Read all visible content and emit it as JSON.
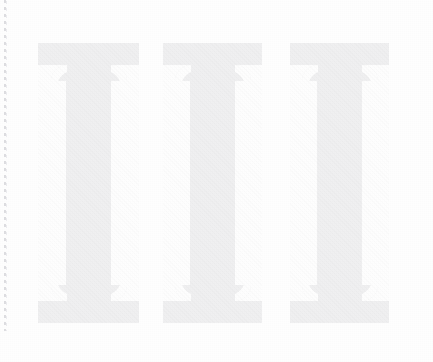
{
  "page": {
    "background_color": "#fefefe",
    "width": 433,
    "height": 362
  },
  "margin_rule": {
    "name": "dashed-margin-rule",
    "color": "#d8d8dc",
    "style": "dashed-vertical"
  },
  "numeral": {
    "text": "III",
    "value": "3",
    "style": "slab-serif",
    "ink_color": "#f0f0f1",
    "glyphs": [
      {
        "char": "I",
        "label": "roman-numeral-stroke-1"
      },
      {
        "char": "I",
        "label": "roman-numeral-stroke-2"
      },
      {
        "char": "I",
        "label": "roman-numeral-stroke-3"
      }
    ]
  }
}
